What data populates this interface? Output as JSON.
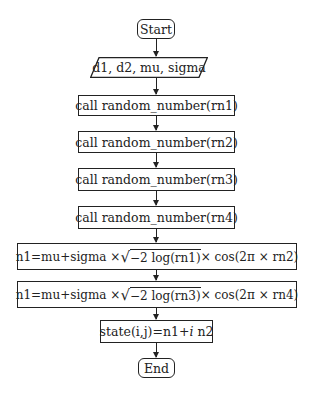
{
  "flowchart": {
    "start": "Start",
    "input": "d1, d2, mu, sigma",
    "calls": [
      "call random_number(rn1)",
      "call random_number(rn2)",
      "call random_number(rn3)",
      "call random_number(rn4)"
    ],
    "formula1": {
      "lhs": "n1=mu+sigma ×",
      "radical": "√",
      "sqrt_arg": "−2 log(rn1)",
      "rhs": "× cos(2π × rn2)"
    },
    "formula2": {
      "lhs": "n1=mu+sigma ×",
      "radical": "√",
      "sqrt_arg": "−2 log(rn3)",
      "rhs": "× cos(2π × rn4)"
    },
    "state": {
      "prefix": "state(i,j)=n1+",
      "imag": "i",
      "suffix": " n2"
    },
    "end": "End"
  }
}
